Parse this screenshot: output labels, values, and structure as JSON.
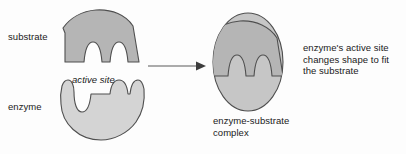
{
  "diagram": {
    "type": "biology-process-diagram",
    "background_color": "#fdfdfd",
    "outline_color": "#4f4f4f",
    "labels": {
      "substrate": "substrate",
      "enzyme": "enzyme",
      "active_site": "active site",
      "complex": "enzyme-substrate\ncomplex",
      "description": "enzyme's active site\nchanges shape to fit\nthe substrate"
    },
    "shapes": {
      "substrate": {
        "name": "substrate",
        "fill": "#b5b5b5",
        "stroke": "#4f4f4f",
        "description": "dome with flat left leg and two U-shaped prongs"
      },
      "enzyme": {
        "name": "enzyme",
        "fill": "#d4d4d4",
        "stroke": "#4f4f4f",
        "description": "circle with notched upper edge forming the active site"
      },
      "complex_enzyme": {
        "name": "enzyme-substrate-complex-enzyme-body",
        "fill": "#c6c6c6",
        "stroke": "#4f4f4f"
      },
      "complex_substrate": {
        "name": "enzyme-substrate-complex-substrate-body",
        "fill": "#b5b5b5",
        "stroke": "#4f4f4f"
      }
    },
    "arrow": {
      "name": "process-arrow",
      "direction": "right",
      "color": "#5a5a5a"
    }
  }
}
